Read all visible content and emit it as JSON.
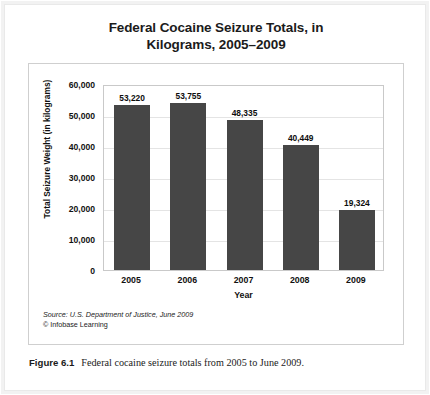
{
  "figure": {
    "caption_label": "Figure 6.1",
    "caption_text": "Federal cocaine seizure totals from 2005 to June 2009."
  },
  "chart": {
    "source_line": "Source: U.S. Department of Justice, June 2009",
    "copyright_line": "© Infobase Learning",
    "bar_color": "#464646",
    "gridline_color": "#e4e4e4",
    "panel_border_color": "#cfcfcf"
  },
  "chart_data": {
    "type": "bar",
    "title": "Federal Cocaine Seizure Totals, in Kilograms, 2005–2009",
    "title_lines": [
      "Federal Cocaine Seizure Totals, in",
      "Kilograms, 2005–2009"
    ],
    "categories": [
      "2005",
      "2006",
      "2007",
      "2008",
      "2009"
    ],
    "values": [
      53220,
      53755,
      48335,
      40449,
      19324
    ],
    "value_labels": [
      "53,220",
      "53,755",
      "48,335",
      "40,449",
      "19,324"
    ],
    "xlabel": "Year",
    "ylabel": "Total Seizure Weight (in kilograms)",
    "ylim": [
      0,
      60000
    ],
    "yticks": [
      0,
      10000,
      20000,
      30000,
      40000,
      50000,
      60000
    ],
    "ytick_labels": [
      "0",
      "10,000",
      "20,000",
      "30,000",
      "40,000",
      "50,000",
      "60,000"
    ],
    "grid": true,
    "legend": false
  }
}
